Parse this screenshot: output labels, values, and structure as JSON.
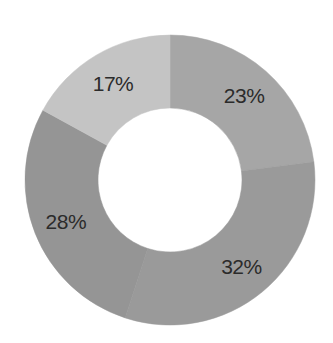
{
  "chart_data": {
    "type": "pie",
    "subtype": "donut",
    "title": "",
    "start_angle_deg": 0,
    "direction": "clockwise",
    "slices": [
      {
        "label": "23%",
        "value": 23,
        "color": "#a6a6a6"
      },
      {
        "label": "32%",
        "value": 32,
        "color": "#9a9a9a"
      },
      {
        "label": "28%",
        "value": 28,
        "color": "#959595"
      },
      {
        "label": "17%",
        "value": 17,
        "color": "#c4c4c4"
      }
    ],
    "values": [
      23,
      32,
      28,
      17
    ],
    "legend": [],
    "data_labels": [
      "23%",
      "32%",
      "28%",
      "17%"
    ]
  },
  "layout": {
    "center_x": 170,
    "center_y": 180,
    "outer_radius": 145,
    "inner_radius": 72,
    "label_radius": 112,
    "background": "#ffffff",
    "label_color": "#2b2b2b"
  }
}
